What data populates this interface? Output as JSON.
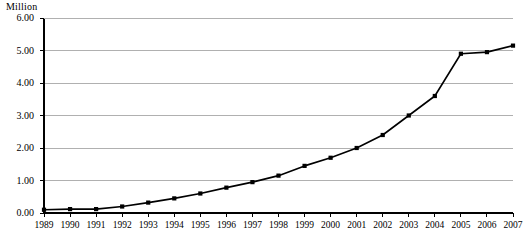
{
  "chart_data": {
    "type": "line",
    "title": "",
    "subtitle": "",
    "ylabel": "Million",
    "xlabel": "",
    "ylim": [
      0,
      6
    ],
    "ytick_values": [
      0,
      1,
      2,
      3,
      4,
      5,
      6
    ],
    "ytick_labels": [
      "0.00",
      "1.00",
      "2.00",
      "3.00",
      "4.00",
      "5.00",
      "6.00"
    ],
    "grid": "horizontal",
    "legend": "none",
    "marker": "square",
    "line_color": "#000000",
    "grid_color": "#b0b0b0",
    "axis_color": "#000000",
    "categories": [
      "1989",
      "1990",
      "1991",
      "1992",
      "1993",
      "1994",
      "1995",
      "1996",
      "1997",
      "1998",
      "1999",
      "2000",
      "2001",
      "2002",
      "2003",
      "2004",
      "2005",
      "2006",
      "2007"
    ],
    "values": [
      0.1,
      0.12,
      0.12,
      0.2,
      0.32,
      0.45,
      0.6,
      0.78,
      0.95,
      1.15,
      1.45,
      1.7,
      2.0,
      2.4,
      3.0,
      3.6,
      4.9,
      4.95,
      5.15
    ]
  }
}
